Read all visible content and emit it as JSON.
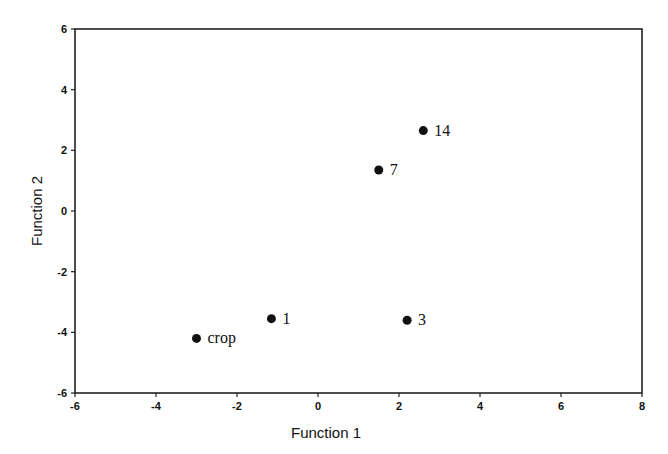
{
  "chart_data": {
    "type": "scatter",
    "title": "",
    "xlabel": "Function 1",
    "ylabel": "Function 2",
    "xlim": [
      -6,
      8
    ],
    "ylim": [
      -6,
      6
    ],
    "xticks": [
      -6,
      -4,
      -2,
      0,
      2,
      4,
      6,
      8
    ],
    "yticks": [
      -6,
      -4,
      -2,
      0,
      2,
      4,
      6
    ],
    "grid": false,
    "legend": null,
    "points": [
      {
        "label": "14",
        "x": 2.6,
        "y": 2.65
      },
      {
        "label": "7",
        "x": 1.5,
        "y": 1.35
      },
      {
        "label": "1",
        "x": -1.15,
        "y": -3.55
      },
      {
        "label": "crop",
        "x": -3.0,
        "y": -4.2
      },
      {
        "label": "3",
        "x": 2.2,
        "y": -3.6
      }
    ]
  },
  "layout": {
    "plot": {
      "left": 75,
      "top": 29,
      "right": 642,
      "bottom": 393
    },
    "marker_color": "#111111",
    "axis_color": "#222222"
  }
}
